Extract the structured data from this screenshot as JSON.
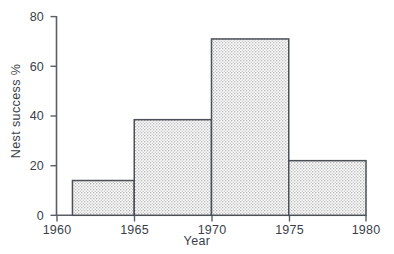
{
  "chart_data": {
    "type": "bar",
    "title": "",
    "subtitle": "",
    "xlabel": "Year",
    "ylabel": "Nest success  %",
    "xlim": [
      1960,
      1980
    ],
    "ylim": [
      0,
      80
    ],
    "grid": false,
    "legend": null,
    "xtick_labels": [
      "1960",
      "1965",
      "1970",
      "1975",
      "1980"
    ],
    "xticks": [
      1960,
      1965,
      1970,
      1975,
      1980
    ],
    "ytick_labels": [
      "0",
      "20",
      "40",
      "60",
      "80"
    ],
    "yticks": [
      0,
      20,
      40,
      60,
      80
    ],
    "bar_style": {
      "fill": "stippled-gray",
      "fill_color": "#d9d9d9",
      "edge_color": "#4a4f58"
    },
    "bins": [
      {
        "label": "1961-1965",
        "x_start": 1961,
        "x_end": 1965,
        "value": 14
      },
      {
        "label": "1965-1970",
        "x_start": 1965,
        "x_end": 1970,
        "value": 38.5
      },
      {
        "label": "1970-1975",
        "x_start": 1970,
        "x_end": 1975,
        "value": 71
      },
      {
        "label": "1975-1980",
        "x_start": 1975,
        "x_end": 1980,
        "value": 22
      }
    ],
    "categories": [
      "1961-1965",
      "1965-1970",
      "1970-1975",
      "1975-1980"
    ],
    "values": [
      14,
      38.5,
      71,
      22
    ]
  },
  "axis": {
    "x_title": "Year",
    "y_title": "Nest success  %"
  }
}
